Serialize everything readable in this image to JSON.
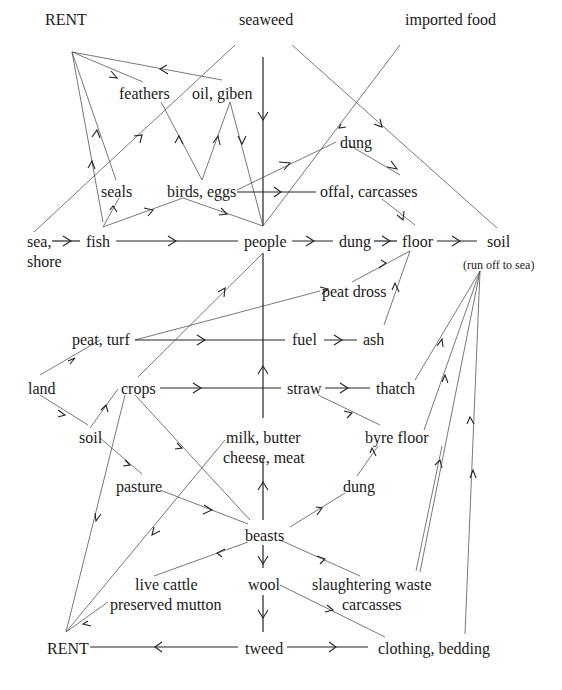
{
  "diagram": {
    "title": "",
    "nodes": {
      "rent_top": {
        "label": "RENT",
        "x": 45,
        "y": 11
      },
      "seaweed": {
        "label": "seaweed",
        "x": 239,
        "y": 11
      },
      "imported_food": {
        "label": "imported food",
        "x": 405,
        "y": 11
      },
      "feathers": {
        "label": "feathers",
        "x": 119,
        "y": 85
      },
      "oil_giben": {
        "label": "oil, giben",
        "x": 192,
        "y": 85
      },
      "dung_top": {
        "label": "dung",
        "x": 340,
        "y": 134
      },
      "seals": {
        "label": "seals",
        "x": 101,
        "y": 183
      },
      "birds_eggs": {
        "label": "birds, eggs",
        "x": 167,
        "y": 183
      },
      "offal_carcasses": {
        "label": "offal, carcasses",
        "x": 320,
        "y": 183
      },
      "sea_shore_1": {
        "label": "sea,",
        "x": 27,
        "y": 233
      },
      "sea_shore_2": {
        "label": "shore",
        "x": 27,
        "y": 253
      },
      "fish": {
        "label": "fish",
        "x": 86,
        "y": 233
      },
      "people": {
        "label": "people",
        "x": 244,
        "y": 233
      },
      "dung_mid": {
        "label": "dung",
        "x": 339,
        "y": 233
      },
      "floor": {
        "label": "floor",
        "x": 402,
        "y": 233
      },
      "soil_right": {
        "label": "soil",
        "x": 487,
        "y": 233
      },
      "run_off": {
        "label": "(run off to sea)",
        "x": 463,
        "y": 256
      },
      "peat_dross": {
        "label": "peat dross",
        "x": 322,
        "y": 283
      },
      "peat_turf": {
        "label": "peat, turf",
        "x": 72,
        "y": 331
      },
      "fuel": {
        "label": "fuel",
        "x": 292,
        "y": 331
      },
      "ash": {
        "label": "ash",
        "x": 363,
        "y": 331
      },
      "land": {
        "label": "land",
        "x": 28,
        "y": 380
      },
      "crops": {
        "label": "crops",
        "x": 121,
        "y": 380
      },
      "straw": {
        "label": "straw",
        "x": 287,
        "y": 380
      },
      "thatch": {
        "label": "thatch",
        "x": 376,
        "y": 380
      },
      "soil_left": {
        "label": "soil",
        "x": 79,
        "y": 429
      },
      "milk_butter": {
        "label": "milk, butter",
        "x": 226,
        "y": 429
      },
      "cheese_meat": {
        "label": "cheese, meat",
        "x": 223,
        "y": 449
      },
      "byre_floor": {
        "label": "byre floor",
        "x": 365,
        "y": 429
      },
      "pasture": {
        "label": "pasture",
        "x": 116,
        "y": 478
      },
      "dung_low": {
        "label": "dung",
        "x": 343,
        "y": 478
      },
      "beasts": {
        "label": "beasts",
        "x": 245,
        "y": 527
      },
      "live_cattle": {
        "label": "live cattle",
        "x": 135,
        "y": 576
      },
      "preserved_mutton": {
        "label": "preserved mutton",
        "x": 110,
        "y": 596
      },
      "wool": {
        "label": "wool",
        "x": 248,
        "y": 576
      },
      "slaughtering_waste": {
        "label": "slaughtering waste",
        "x": 312,
        "y": 576
      },
      "carcasses_low": {
        "label": "carcasses",
        "x": 342,
        "y": 596
      },
      "rent_bottom": {
        "label": "RENT",
        "x": 47,
        "y": 640
      },
      "tweed": {
        "label": "tweed",
        "x": 245,
        "y": 640
      },
      "clothing_bedding": {
        "label": "clothing, bedding",
        "x": 378,
        "y": 640
      }
    },
    "edges": [
      {
        "from": "oil_giben",
        "to": "rent_top"
      },
      {
        "from": "feathers",
        "to": "rent_top"
      },
      {
        "from": "seals",
        "to": "rent_top"
      },
      {
        "from": "fish",
        "to": "rent_top"
      },
      {
        "from": "sea_shore",
        "to": "seaweed"
      },
      {
        "from": "seaweed",
        "to": "people"
      },
      {
        "from": "seaweed",
        "to": "soil_right"
      },
      {
        "from": "imported_food",
        "to": "people"
      },
      {
        "from": "birds_eggs",
        "to": "feathers"
      },
      {
        "from": "birds_eggs",
        "to": "oil_giben"
      },
      {
        "from": "oil_giben",
        "to": "people"
      },
      {
        "from": "birds_eggs",
        "to": "dung_top"
      },
      {
        "from": "dung_top",
        "to": "soil_right"
      },
      {
        "from": "birds_eggs",
        "to": "offal_carcasses"
      },
      {
        "from": "birds_eggs",
        "to": "people"
      },
      {
        "from": "fish",
        "to": "seals"
      },
      {
        "from": "fish",
        "to": "birds_eggs"
      },
      {
        "from": "sea_shore",
        "to": "fish"
      },
      {
        "from": "fish",
        "to": "people"
      },
      {
        "from": "people",
        "to": "dung_mid"
      },
      {
        "from": "dung_mid",
        "to": "floor"
      },
      {
        "from": "offal_carcasses",
        "to": "floor"
      },
      {
        "from": "floor",
        "to": "soil_right"
      },
      {
        "from": "peat_turf",
        "to": "peat_dross"
      },
      {
        "from": "peat_dross",
        "to": "floor"
      },
      {
        "from": "ash",
        "to": "floor"
      },
      {
        "from": "peat_turf",
        "to": "fuel"
      },
      {
        "from": "fuel",
        "to": "ash"
      },
      {
        "from": "land",
        "to": "peat_turf"
      },
      {
        "from": "land",
        "to": "soil_left"
      },
      {
        "from": "soil_left",
        "to": "crops"
      },
      {
        "from": "crops",
        "to": "people"
      },
      {
        "from": "crops",
        "to": "straw"
      },
      {
        "from": "straw",
        "to": "thatch"
      },
      {
        "from": "straw",
        "to": "byre_floor"
      },
      {
        "from": "thatch",
        "to": "soil_right"
      },
      {
        "from": "byre_floor",
        "to": "soil_right"
      },
      {
        "from": "crops",
        "to": "beasts"
      },
      {
        "from": "crops",
        "to": "rent_bottom"
      },
      {
        "from": "soil_left",
        "to": "pasture"
      },
      {
        "from": "pasture",
        "to": "beasts"
      },
      {
        "from": "milk_butter",
        "to": "people"
      },
      {
        "from": "milk_butter",
        "to": "rent_bottom"
      },
      {
        "from": "beasts",
        "to": "milk_butter"
      },
      {
        "from": "beasts",
        "to": "dung_low"
      },
      {
        "from": "dung_low",
        "to": "byre_floor"
      },
      {
        "from": "beasts",
        "to": "live_cattle"
      },
      {
        "from": "beasts",
        "to": "wool"
      },
      {
        "from": "beasts",
        "to": "slaughtering_waste"
      },
      {
        "from": "slaughtering_waste",
        "to": "soil_right"
      },
      {
        "from": "preserved_mutton",
        "to": "rent_bottom"
      },
      {
        "from": "wool",
        "to": "tweed"
      },
      {
        "from": "wool",
        "to": "clothing_bedding"
      },
      {
        "from": "tweed",
        "to": "rent_bottom"
      },
      {
        "from": "tweed",
        "to": "clothing_bedding"
      },
      {
        "from": "clothing_bedding",
        "to": "soil_right"
      }
    ]
  }
}
